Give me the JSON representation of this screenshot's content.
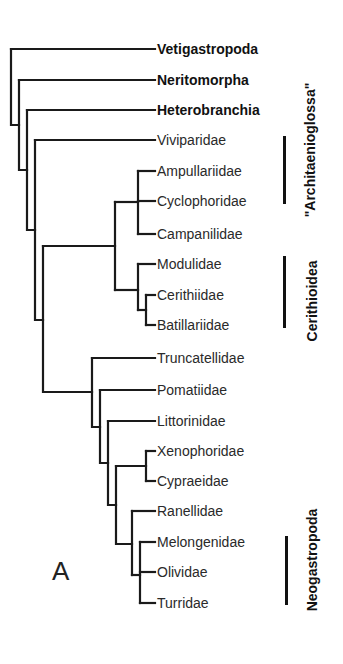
{
  "figure": {
    "panel_label": "A",
    "taxa": [
      {
        "name": "Vetigastropoda",
        "bold": true,
        "y": 49
      },
      {
        "name": "Neritomorpha",
        "bold": true,
        "y": 80
      },
      {
        "name": "Heterobranchia",
        "bold": true,
        "y": 110
      },
      {
        "name": "Viviparidae",
        "bold": false,
        "y": 140
      },
      {
        "name": "Ampullariidae",
        "bold": false,
        "y": 171
      },
      {
        "name": "Cyclophoridae",
        "bold": false,
        "y": 201
      },
      {
        "name": "Campanilidae",
        "bold": false,
        "y": 234
      },
      {
        "name": "Modulidae",
        "bold": false,
        "y": 264
      },
      {
        "name": "Cerithiidae",
        "bold": false,
        "y": 295
      },
      {
        "name": "Batillariidae",
        "bold": false,
        "y": 325
      },
      {
        "name": "Truncatellidae",
        "bold": false,
        "y": 358
      },
      {
        "name": "Pomatiidae",
        "bold": false,
        "y": 390
      },
      {
        "name": "Littorinidae",
        "bold": false,
        "y": 421
      },
      {
        "name": "Xenophoridae",
        "bold": false,
        "y": 451
      },
      {
        "name": "Cypraeidae",
        "bold": false,
        "y": 481
      },
      {
        "name": "Ranellidae",
        "bold": false,
        "y": 511
      },
      {
        "name": "Melongenidae",
        "bold": false,
        "y": 542
      },
      {
        "name": "Olividae",
        "bold": false,
        "y": 572
      },
      {
        "name": "Turridae",
        "bold": false,
        "y": 603
      }
    ],
    "clades": [
      {
        "name": "\"Architaenioglossa\"",
        "bar_top": 136,
        "bar_bottom": 204,
        "label_center_y": 150
      },
      {
        "name": "Cerithioidea",
        "bar_top": 256,
        "bar_bottom": 328,
        "label_center_y": 301
      },
      {
        "name": "Neogastropoda",
        "bar_top": 536,
        "bar_bottom": 605,
        "label_center_y": 560
      }
    ]
  }
}
